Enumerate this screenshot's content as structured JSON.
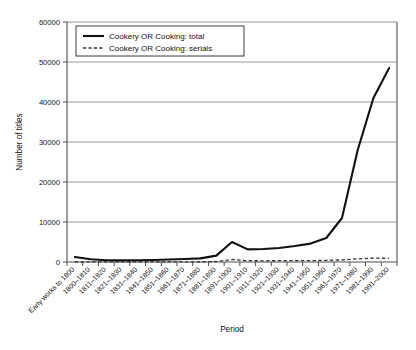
{
  "chart_data": {
    "type": "line",
    "title": "",
    "xlabel": "Period",
    "ylabel": "Number of titles",
    "ylim": [
      0,
      60000
    ],
    "ytick_labels": [
      "0",
      "10000",
      "20000",
      "30000",
      "40000",
      "50000",
      "60000"
    ],
    "ytick_values": [
      0,
      10000,
      20000,
      30000,
      40000,
      50000,
      60000
    ],
    "grid": true,
    "legend_position": "upper-left",
    "categories": [
      "Early works to 1800",
      "1800–1810",
      "1811–1820",
      "1821–1830",
      "1831–1840",
      "1841–1850",
      "1851–1860",
      "1861–1870",
      "1871–1880",
      "1881–1890",
      "1891–1900",
      "1901–1910",
      "1911–1920",
      "1921–1930",
      "1931–1940",
      "1941–1950",
      "1951–1960",
      "1961–1970",
      "1971–1980",
      "1981–1990",
      "1991–2000"
    ],
    "series": [
      {
        "name": "Cookery OR Cooking: total",
        "style": "solid",
        "color": "#111111",
        "values": [
          1250,
          700,
          450,
          400,
          420,
          500,
          620,
          760,
          900,
          1600,
          5000,
          3150,
          3250,
          3500,
          4000,
          4600,
          6000,
          11000,
          28000,
          41000,
          48500
        ]
      },
      {
        "name": "Cookery OR Cooking: serials",
        "style": "dashed",
        "color": "#333333",
        "values": [
          20,
          15,
          15,
          15,
          20,
          25,
          30,
          40,
          60,
          120,
          620,
          330,
          300,
          320,
          330,
          350,
          400,
          520,
          780,
          980,
          900
        ]
      }
    ]
  },
  "legend": {
    "entries": [
      {
        "label": "Cookery OR Cooking: total",
        "style": "solid"
      },
      {
        "label": "Cookery OR Cooking: serials",
        "style": "dashed"
      }
    ]
  },
  "axes": {
    "y_title": "Number of titles",
    "x_title": "Period"
  }
}
